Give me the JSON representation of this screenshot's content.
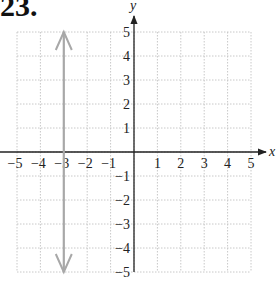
{
  "problem": {
    "number": "23."
  },
  "chart_data": {
    "type": "line",
    "title": "",
    "xlabel": "x",
    "ylabel": "y",
    "xlim": [
      -5,
      5
    ],
    "ylim": [
      -5,
      5
    ],
    "grid": true,
    "x_ticks": [
      "−5",
      "−4",
      "−3",
      "−2",
      "−1",
      "1",
      "2",
      "3",
      "4",
      "5"
    ],
    "y_ticks": [
      "5",
      "4",
      "3",
      "2",
      "1",
      "−1",
      "−2",
      "−3",
      "−4",
      "−5"
    ],
    "series": [
      {
        "name": "vertical line x = -3",
        "equation": "x = -3",
        "points": [
          [
            -3,
            -5
          ],
          [
            -3,
            5
          ]
        ],
        "arrows": "both",
        "color": "#a8a8a8"
      }
    ]
  },
  "colors": {
    "axis": "#222222",
    "grid": "#c8c8c8",
    "graph_line": "#a8a8a8"
  }
}
